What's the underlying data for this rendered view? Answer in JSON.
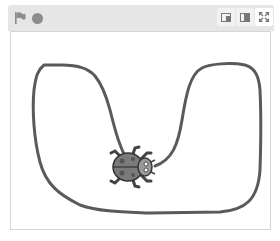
{
  "header": {
    "green_flag": {
      "icon": "flag-icon",
      "color": "#8c8c8c"
    },
    "stop": {
      "icon": "stop-icon",
      "color": "#8c8c8c"
    },
    "buttons": [
      {
        "name": "small-stage-button",
        "icon": "small-stage-icon"
      },
      {
        "name": "large-stage-button",
        "icon": "large-stage-icon"
      },
      {
        "name": "fullscreen-button",
        "icon": "fullscreen-icon"
      }
    ]
  },
  "stage": {
    "background": "#ffffff",
    "pen_color": "#5a5a5a",
    "sprite": {
      "name": "Ladybug",
      "icon": "ladybug-icon",
      "x": 131,
      "y": 167,
      "direction": "right"
    }
  }
}
